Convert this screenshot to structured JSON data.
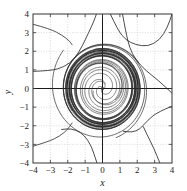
{
  "chart_data": {
    "type": "line",
    "title": "",
    "xlabel": "x",
    "ylabel": "y",
    "xlim": [
      -4,
      4
    ],
    "ylim": [
      -4,
      4
    ],
    "xticks": [
      -4,
      -3,
      -2,
      -1,
      0,
      1,
      2,
      3,
      4
    ],
    "yticks": [
      -4,
      -3,
      -2,
      -1,
      0,
      1,
      2,
      3,
      4
    ],
    "xtick_labels": [
      "-4",
      "-3",
      "-2",
      "-1",
      "0",
      "1",
      "2",
      "3",
      "4"
    ],
    "ytick_labels": [
      "-4",
      "-3",
      "-2",
      "-1",
      "0",
      "1",
      "2",
      "3",
      "4"
    ],
    "grid": true,
    "grid_style": "dotted",
    "grid_color": "#cccccc",
    "frame": true,
    "frame_color": "#333333",
    "axis_line_color": "#1a1a1a",
    "curve_color": "#2b2b2b",
    "legend": null,
    "equilibrium_points": [
      {
        "x": 0,
        "y": 0,
        "type": "unstable-spiral"
      }
    ],
    "limit_cycle": {
      "radius": 2.05,
      "type": "stable",
      "center": [
        0,
        0
      ]
    },
    "series": [
      {
        "name": "limit-cycle",
        "kind": "closed-orbit",
        "radius": 2.05
      },
      {
        "name": "inner-spiral-1",
        "kind": "spiral-out",
        "r_start": 0.06,
        "r_end": 2.0,
        "theta_start": 0.0,
        "turns": 5.2
      },
      {
        "name": "inner-spiral-2",
        "kind": "spiral-out",
        "r_start": 0.09,
        "r_end": 2.0,
        "theta_start": 2.1,
        "turns": 4.8
      },
      {
        "name": "inner-spiral-3",
        "kind": "spiral-out",
        "r_start": 0.13,
        "r_end": 1.99,
        "theta_start": 4.2,
        "turns": 4.4
      },
      {
        "name": "inner-spiral-4",
        "kind": "spiral-out",
        "r_start": 0.3,
        "r_end": 1.98,
        "theta_start": 1.0,
        "turns": 3.6
      },
      {
        "name": "inner-spiral-5",
        "kind": "spiral-out",
        "r_start": 0.55,
        "r_end": 1.98,
        "theta_start": 3.4,
        "turns": 3.0
      },
      {
        "name": "inner-spiral-6",
        "kind": "spiral-out",
        "r_start": 0.95,
        "r_end": 1.97,
        "theta_start": 5.6,
        "turns": 2.4
      },
      {
        "name": "outer-spiral-1",
        "kind": "spiral-in",
        "r_start": 3.05,
        "r_end": 2.12,
        "theta_start": 2.4,
        "turns": 1.9
      },
      {
        "name": "outer-spiral-2",
        "kind": "spiral-in",
        "r_start": 2.75,
        "r_end": 2.1,
        "theta_start": 5.0,
        "turns": 1.7
      },
      {
        "name": "outer-spiral-3",
        "kind": "spiral-in",
        "r_start": 2.5,
        "r_end": 2.09,
        "theta_start": 0.6,
        "turns": 1.5
      },
      {
        "name": "corner-trajectory-upper-left",
        "kind": "open",
        "entry": [
          -4,
          0.92
        ],
        "exit": [
          -0.35,
          4
        ]
      },
      {
        "name": "corner-trajectory-upper-right",
        "kind": "open",
        "entry": [
          0.45,
          4
        ],
        "exit": [
          4,
          4
        ]
      },
      {
        "name": "corner-trajectory-right",
        "kind": "open",
        "entry": [
          1.1,
          4
        ],
        "exit": [
          4,
          -0.25
        ]
      },
      {
        "name": "corner-trajectory-lower-left",
        "kind": "open",
        "entry": [
          -4,
          -3.1
        ],
        "exit": [
          -0.3,
          -4
        ]
      },
      {
        "name": "corner-trajectory-lower-right",
        "kind": "open",
        "entry": [
          4,
          -0.9
        ],
        "exit": [
          0.5,
          -4
        ]
      },
      {
        "name": "corner-trajectory-bottom",
        "kind": "open",
        "entry": [
          2.35,
          -2.0
        ],
        "exit": [
          3.3,
          -4
        ]
      }
    ]
  },
  "figure": {
    "background": "#ffffff",
    "plot_left_px": 33,
    "plot_top_px": 14,
    "plot_width_px": 139,
    "plot_height_px": 149
  }
}
